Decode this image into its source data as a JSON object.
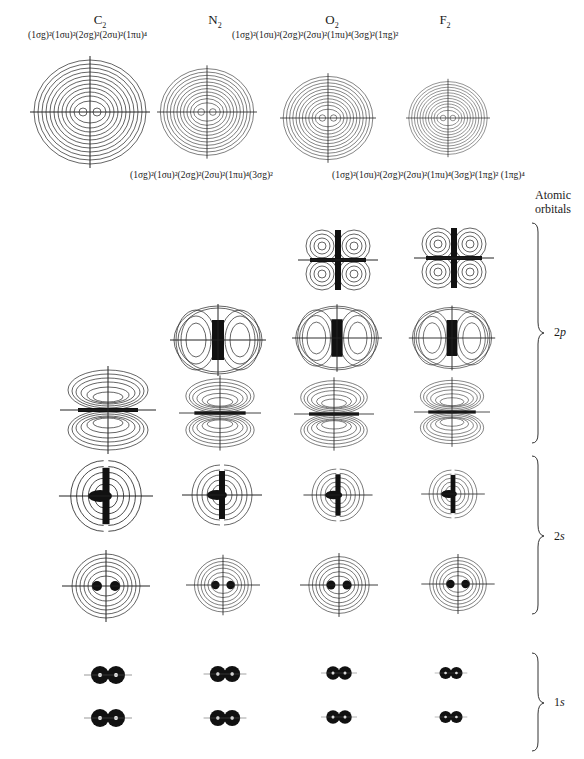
{
  "molecules": [
    {
      "name": "C",
      "sub": "2",
      "config": "(1σg)²(1σu)²(2σg)²(2σu)²(1πu)⁴",
      "config_position": "top"
    },
    {
      "name": "N",
      "sub": "2",
      "config": "(1σg)²(1σu)²(2σg)²(2σu)²(1πu)⁴(3σg)²",
      "config_position": "bottom"
    },
    {
      "name": "O",
      "sub": "2",
      "config": "(1σg)²(1σu)²(2σg)²(2σu)²(1πu)⁴(3σg)²(1πg)²",
      "config_position": "top"
    },
    {
      "name": "F",
      "sub": "2",
      "config": "(1σg)²(1σu)²(2σg)²(2σu)²(1πu)⁴(3σg)²(1πg)² (1πg)⁴",
      "config_position": "bottom"
    }
  ],
  "right_header": {
    "line1": "Atomic",
    "line2": "orbitals"
  },
  "groups": [
    {
      "label_n": "2",
      "label_l": "p",
      "id": "2p"
    },
    {
      "label_n": "2",
      "label_l": "s",
      "id": "2s"
    },
    {
      "label_n": "1",
      "label_l": "s",
      "id": "1s"
    }
  ],
  "figure": {
    "columns": [
      "C2",
      "N2",
      "O2",
      "F2"
    ],
    "rows": [
      "total-density",
      "1πg",
      "1πu",
      "3σg",
      "2σu",
      "2σg",
      "1σu",
      "1σg"
    ]
  }
}
